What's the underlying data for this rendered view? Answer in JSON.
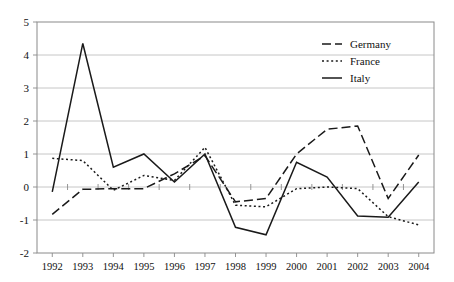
{
  "chart_data": {
    "type": "line",
    "title": "",
    "subtitle": "",
    "xlabel": "",
    "ylabel": "",
    "categories": [
      "1992",
      "1993",
      "1994",
      "1995",
      "1996",
      "1997",
      "1998",
      "1999",
      "2000",
      "2001",
      "2002",
      "2003",
      "2004"
    ],
    "x": [
      1992,
      1993,
      1994,
      1995,
      1996,
      1997,
      1998,
      1999,
      2000,
      2001,
      2002,
      2003,
      2004
    ],
    "ylim": [
      -2,
      5
    ],
    "ytick_labels": [
      "5",
      "4",
      "3",
      "2",
      "1",
      "0",
      "-1",
      "-2"
    ],
    "yticks": [
      5,
      4,
      3,
      2,
      1,
      0,
      -1,
      -2
    ],
    "grid": true,
    "legend_position": "upper-right-inside",
    "series": [
      {
        "name": "Germany",
        "style": "dashed",
        "color": "#1a1a1a",
        "values": [
          -0.83,
          -0.07,
          -0.05,
          -0.05,
          0.4,
          0.95,
          -0.45,
          -0.35,
          1.0,
          1.75,
          1.85,
          -0.35,
          0.97
        ]
      },
      {
        "name": "France",
        "style": "dotted",
        "color": "#1a1a1a",
        "values": [
          0.87,
          0.8,
          -0.1,
          0.35,
          0.2,
          1.2,
          -0.55,
          -0.6,
          -0.05,
          0.0,
          -0.05,
          -0.9,
          -1.15
        ]
      },
      {
        "name": "Italy",
        "style": "solid",
        "color": "#1a1a1a",
        "values": [
          -0.15,
          4.35,
          0.6,
          1.0,
          0.15,
          1.0,
          -1.22,
          -1.45,
          0.75,
          0.3,
          -0.88,
          -0.92,
          0.15
        ]
      }
    ]
  },
  "legend": {
    "entries": [
      {
        "label": "Germany",
        "style": "dashed"
      },
      {
        "label": "France",
        "style": "dotted"
      },
      {
        "label": "Italy",
        "style": "solid"
      }
    ]
  }
}
